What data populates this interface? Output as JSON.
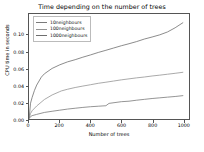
{
  "chart_data": {
    "type": "line",
    "title": "Time depending on the number of trees",
    "xlabel": "Number of trees",
    "ylabel": "CPU time in seconds",
    "xlim": [
      0,
      1040
    ],
    "ylim": [
      0,
      0.125
    ],
    "grid": false,
    "legend_position": "upper-left",
    "xticks": [
      0,
      200,
      400,
      600,
      800,
      1000
    ],
    "xtick_labels": [
      "0",
      "200",
      "400",
      "600",
      "800",
      "1000"
    ],
    "yticks": [
      0.0,
      0.02,
      0.04,
      0.06,
      0.08,
      0.1
    ],
    "ytick_labels": [
      "0.00",
      "0.02",
      "0.04",
      "0.06",
      "0.08",
      "0.10"
    ],
    "series": [
      {
        "name": "10neighbours",
        "color": "#7a7a7a",
        "x": [
          1,
          10,
          20,
          50,
          100,
          150,
          200,
          250,
          300,
          350,
          400,
          450,
          500,
          520,
          600,
          650,
          700,
          750,
          800,
          850,
          900,
          950,
          1000
        ],
        "values": [
          0.0005,
          0.0028,
          0.004,
          0.0055,
          0.0078,
          0.0092,
          0.0105,
          0.0118,
          0.0128,
          0.0138,
          0.0146,
          0.0152,
          0.0158,
          0.0186,
          0.0206,
          0.0212,
          0.0224,
          0.0234,
          0.0244,
          0.0252,
          0.026,
          0.0268,
          0.0278
        ]
      },
      {
        "name": "100neighbours",
        "color": "#949494",
        "x": [
          1,
          10,
          20,
          50,
          100,
          150,
          200,
          210,
          250,
          300,
          350,
          400,
          450,
          500,
          550,
          600,
          650,
          700,
          750,
          800,
          850,
          900,
          950,
          1000
        ],
        "values": [
          0.001,
          0.0065,
          0.0098,
          0.0155,
          0.0232,
          0.0286,
          0.0326,
          0.0334,
          0.0354,
          0.0375,
          0.0392,
          0.0408,
          0.0425,
          0.0438,
          0.0452,
          0.0466,
          0.0478,
          0.049,
          0.05,
          0.0512,
          0.0522,
          0.0533,
          0.0544,
          0.0556
        ]
      },
      {
        "name": "1000neighbours",
        "color": "#6e6e6e",
        "x": [
          1,
          10,
          20,
          35,
          50,
          80,
          100,
          150,
          200,
          250,
          300,
          350,
          400,
          450,
          500,
          550,
          600,
          650,
          700,
          750,
          800,
          850,
          900,
          950,
          1000
        ],
        "values": [
          0.0012,
          0.0188,
          0.0255,
          0.0338,
          0.0404,
          0.0498,
          0.0538,
          0.0602,
          0.0645,
          0.068,
          0.0706,
          0.0736,
          0.0763,
          0.0792,
          0.0818,
          0.0845,
          0.0872,
          0.0896,
          0.0922,
          0.0952,
          0.0976,
          0.1002,
          0.1036,
          0.1086,
          0.1146
        ]
      }
    ]
  }
}
